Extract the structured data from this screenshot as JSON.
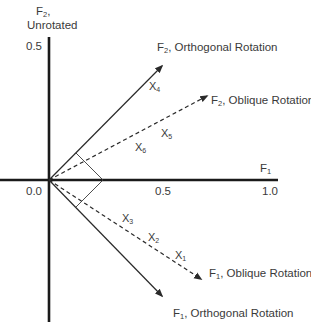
{
  "diagram": {
    "type": "factor-rotation",
    "axes": {
      "y_axis": {
        "label_main": "F",
        "label_sub": "2",
        "label_suffix": ",",
        "label_line2": "Unrotated",
        "tick": "0.5"
      },
      "x_axis": {
        "label_main": "F",
        "label_sub": "1",
        "tick_origin": "0.0",
        "tick_mid": "0.5",
        "tick_end": "1.0"
      }
    },
    "vectors": [
      {
        "id": "f2-orthogonal",
        "main": "F",
        "sub": "2",
        "text": ", Orthogonal Rotation",
        "style": "solid"
      },
      {
        "id": "f2-oblique",
        "main": "F",
        "sub": "2",
        "text": ", Oblique Rotation",
        "style": "dashed"
      },
      {
        "id": "f1-oblique",
        "main": "F",
        "sub": "1",
        "text": ", Oblique Rotation",
        "style": "dashed"
      },
      {
        "id": "f1-orthogonal",
        "main": "F",
        "sub": "1",
        "text": ", Orthogonal Rotation",
        "style": "solid"
      }
    ],
    "variables": [
      {
        "main": "X",
        "sub": "1"
      },
      {
        "main": "X",
        "sub": "2"
      },
      {
        "main": "X",
        "sub": "3"
      },
      {
        "main": "X",
        "sub": "4"
      },
      {
        "main": "X",
        "sub": "5"
      },
      {
        "main": "X",
        "sub": "6"
      }
    ],
    "colors": {
      "axis": "#1a1a1a",
      "line": "#2a2a2a",
      "text": "#3a3a3a"
    }
  }
}
